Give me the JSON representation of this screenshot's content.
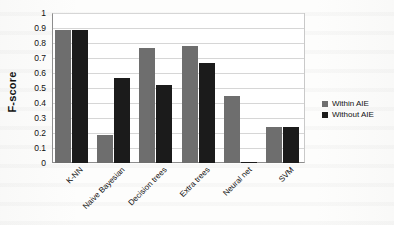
{
  "chart_data": {
    "type": "bar",
    "title": "",
    "xlabel": "",
    "ylabel": "F-score",
    "ylim": [
      0,
      1
    ],
    "yticks": [
      "0",
      "0.1",
      "0.2",
      "0.3",
      "0.4",
      "0.5",
      "0.6",
      "0.7",
      "0.8",
      "0.9",
      "1"
    ],
    "grid": true,
    "legend_position": "right",
    "categories": [
      "K-NN",
      "Naive Bayesian",
      "Decision trees",
      "Extra trees",
      "Neural net",
      "SVM"
    ],
    "series": [
      {
        "name": "Within AIE",
        "color": "#6e6e6e",
        "values": [
          0.89,
          0.19,
          0.77,
          0.78,
          0.45,
          0.24
        ]
      },
      {
        "name": "Without AIE",
        "color": "#1b1b1b",
        "values": [
          0.89,
          0.57,
          0.52,
          0.67,
          0.01,
          0.24
        ]
      }
    ]
  },
  "legend": {
    "items": [
      {
        "label": "Within AIE",
        "swatch": "within"
      },
      {
        "label": "Without AIE",
        "swatch": "without"
      }
    ]
  }
}
